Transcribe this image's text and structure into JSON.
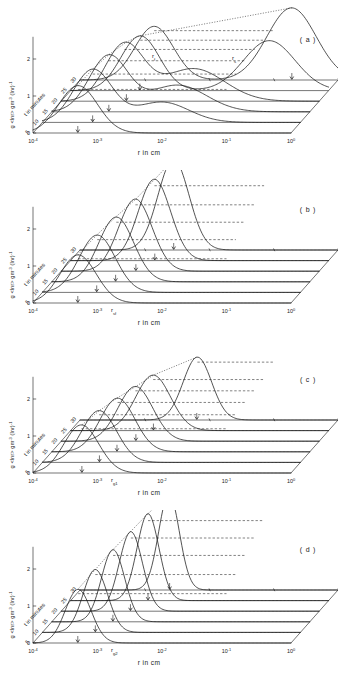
{
  "figure": {
    "panel_count": 4
  },
  "axes": {
    "x_label": "r in cm",
    "y_label_parts": {
      "main": "g <lnr> gm",
      "sup1": "-3",
      "mid": " (lnr)",
      "sup2": "-1"
    },
    "y_label_text": "g <lnr> gm-3 (lnr)-1",
    "depth_label": "t in minutes",
    "x_ticks": [
      {
        "mantissa": "10",
        "exp": "-4"
      },
      {
        "mantissa": "10",
        "exp": "-3"
      },
      {
        "mantissa": "10",
        "exp": "-2"
      },
      {
        "mantissa": "10",
        "exp": "-1"
      },
      {
        "mantissa": "10",
        "exp": "0"
      }
    ],
    "y_ticks": [
      "0",
      "1",
      "2"
    ],
    "depth_ticks": [
      "5",
      "10",
      "15",
      "20",
      "25",
      "30"
    ]
  },
  "panels": [
    {
      "letter": "( a )",
      "annotations": [
        {
          "text": "r",
          "sub": "f",
          "x": 152,
          "y": 58
        },
        {
          "text": "r",
          "sub": "s",
          "x": 232,
          "y": 60
        }
      ]
    },
    {
      "letter": "( b )",
      "annotations": [
        {
          "text": "r",
          "sub": "sf",
          "x": 111,
          "y": 312
        }
      ]
    },
    {
      "letter": "( c )",
      "annotations": [
        {
          "text": "r",
          "sub": "g1",
          "x": 111,
          "y": 482
        }
      ]
    },
    {
      "letter": "( d )",
      "annotations": [
        {
          "text": "r",
          "sub": "g2",
          "x": 111,
          "y": 652
        }
      ]
    }
  ],
  "chart_data": {
    "type": "line",
    "xlabel": "r in cm",
    "ylabel": "g <lnr> gm-3 (lnr)-1",
    "zlabel": "t in minutes",
    "x_scale": "log",
    "xlim": [
      0.0001,
      1.0
    ],
    "ylim": [
      0,
      2.6
    ],
    "xticklabels": [
      "10^-4",
      "10^-3",
      "10^-2",
      "10^-1",
      "10^0"
    ],
    "yticklabels": [
      "0",
      "1",
      "2"
    ],
    "series_times": [
      5,
      10,
      15,
      20,
      25,
      30
    ],
    "grid": false,
    "legend": "none",
    "panels": [
      {
        "label": "( a )",
        "series": [
          {
            "name": "t = 5",
            "peaks": [
              {
                "log_r": -3.3,
                "height": 1.28,
                "width": 0.3
              }
            ]
          },
          {
            "name": "t = 10",
            "peaks": [
              {
                "log_r": -3.22,
                "height": 1.42,
                "width": 0.3
              },
              {
                "log_r": -2.15,
                "height": 0.55,
                "width": 0.42
              }
            ]
          },
          {
            "name": "t = 15",
            "peaks": [
              {
                "log_r": -3.12,
                "height": 1.5,
                "width": 0.3
              },
              {
                "log_r": -2.05,
                "height": 0.72,
                "width": 0.45
              }
            ]
          },
          {
            "name": "t = 20",
            "peaks": [
              {
                "log_r": -3.02,
                "height": 1.52,
                "width": 0.3
              },
              {
                "log_r": -1.95,
                "height": 0.88,
                "width": 0.48
              }
            ]
          },
          {
            "name": "t = 25",
            "peaks": [
              {
                "log_r": -2.92,
                "height": 1.48,
                "width": 0.3
              },
              {
                "log_r": -0.92,
                "height": 1.35,
                "width": 0.4
              }
            ]
          },
          {
            "name": "t = 30",
            "peaks": [
              {
                "log_r": -2.85,
                "height": 1.45,
                "width": 0.3
              },
              {
                "log_r": -0.72,
                "height": 1.95,
                "width": 0.38
              }
            ]
          }
        ]
      },
      {
        "label": "( b )",
        "series": [
          {
            "name": "t = 5",
            "peaks": [
              {
                "log_r": -3.3,
                "height": 1.3,
                "width": 0.28
              }
            ]
          },
          {
            "name": "t = 10",
            "peaks": [
              {
                "log_r": -3.15,
                "height": 1.55,
                "width": 0.28
              }
            ]
          },
          {
            "name": "t = 15",
            "peaks": [
              {
                "log_r": -3.0,
                "height": 1.75,
                "width": 0.27
              }
            ]
          },
          {
            "name": "t = 20",
            "peaks": [
              {
                "log_r": -2.85,
                "height": 1.95,
                "width": 0.26
              }
            ]
          },
          {
            "name": "t = 25",
            "peaks": [
              {
                "log_r": -2.7,
                "height": 2.2,
                "width": 0.25
              }
            ]
          },
          {
            "name": "t = 30",
            "peaks": [
              {
                "log_r": -2.55,
                "height": 2.45,
                "width": 0.24
              }
            ]
          }
        ]
      },
      {
        "label": "( c )",
        "series": [
          {
            "name": "t = 5",
            "peaks": [
              {
                "log_r": -3.25,
                "height": 1.3,
                "width": 0.27
              }
            ]
          },
          {
            "name": "t = 10",
            "peaks": [
              {
                "log_r": -3.12,
                "height": 1.4,
                "width": 0.27
              }
            ]
          },
          {
            "name": "t = 15",
            "peaks": [
              {
                "log_r": -2.98,
                "height": 1.45,
                "width": 0.27
              }
            ]
          },
          {
            "name": "t = 20",
            "peaks": [
              {
                "log_r": -2.85,
                "height": 1.48,
                "width": 0.27
              }
            ]
          },
          {
            "name": "t = 25",
            "peaks": [
              {
                "log_r": -2.72,
                "height": 1.5,
                "width": 0.27
              }
            ]
          },
          {
            "name": "t = 30",
            "peaks": [
              {
                "log_r": -2.18,
                "height": 1.7,
                "width": 0.22
              }
            ]
          }
        ]
      },
      {
        "label": "( d )",
        "series": [
          {
            "name": "t = 5",
            "peaks": [
              {
                "log_r": -3.3,
                "height": 1.45,
                "width": 0.2
              }
            ]
          },
          {
            "name": "t = 10",
            "peaks": [
              {
                "log_r": -3.18,
                "height": 1.7,
                "width": 0.19
              }
            ]
          },
          {
            "name": "t = 15",
            "peaks": [
              {
                "log_r": -3.05,
                "height": 1.95,
                "width": 0.18
              }
            ]
          },
          {
            "name": "t = 20",
            "peaks": [
              {
                "log_r": -2.92,
                "height": 2.15,
                "width": 0.18
              }
            ]
          },
          {
            "name": "t = 25",
            "peaks": [
              {
                "log_r": -2.8,
                "height": 2.35,
                "width": 0.17
              }
            ]
          },
          {
            "name": "t = 30",
            "peaks": [
              {
                "log_r": -2.62,
                "height": 2.6,
                "width": 0.16
              }
            ]
          }
        ]
      }
    ]
  }
}
